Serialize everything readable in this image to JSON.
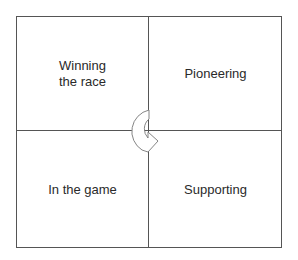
{
  "diagram": {
    "type": "2x2 quadrant matrix",
    "quadrants": {
      "top_left": "Winning\nthe race",
      "top_right": "Pioneering",
      "bottom_left": "In the game",
      "bottom_right": "Supporting"
    },
    "center_icon": "curved-arrow-clockwise-icon",
    "colors": {
      "line": "#555555",
      "text": "#2a2a2a",
      "background": "#ffffff"
    }
  }
}
